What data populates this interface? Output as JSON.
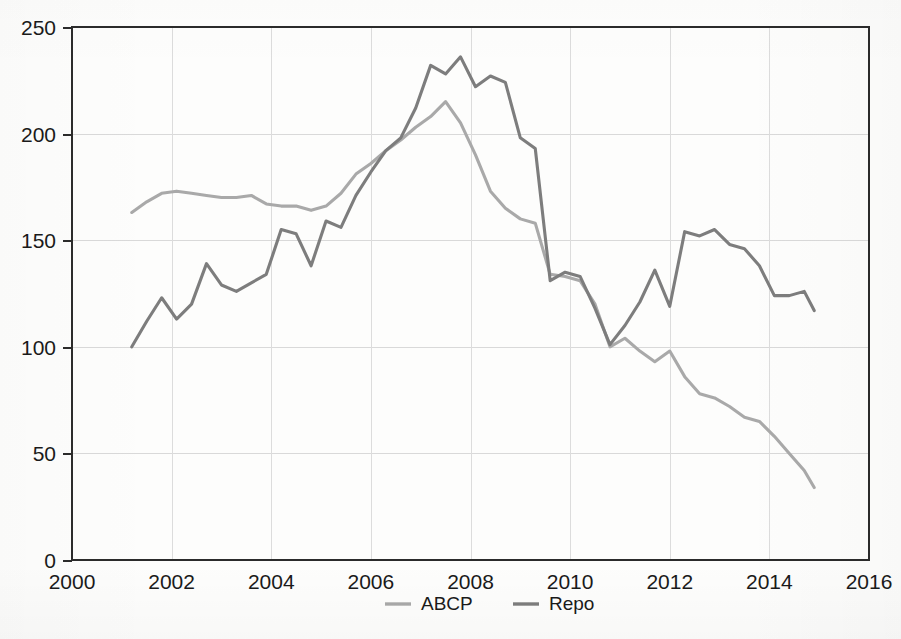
{
  "chart_data": {
    "type": "line",
    "title": "",
    "subtitle": "",
    "xlabel": "",
    "ylabel": "",
    "xlim": [
      2000,
      2016
    ],
    "ylim": [
      0,
      250
    ],
    "xticks": [
      2000,
      2002,
      2004,
      2006,
      2008,
      2010,
      2012,
      2014,
      2016
    ],
    "yticks": [
      0,
      50,
      100,
      150,
      200,
      250
    ],
    "xtick_labels": [
      "2000",
      "2002",
      "2004",
      "2006",
      "2008",
      "2010",
      "2012",
      "2014",
      "2016"
    ],
    "ytick_labels": [
      "0",
      "50",
      "100",
      "150",
      "200",
      "250"
    ],
    "grid": true,
    "grid_axes": "both",
    "legend_position": "bottom-center",
    "legend_entries": [
      "ABCP",
      "Repo"
    ],
    "colors": {
      "ABCP": "#a9a9a9",
      "Repo": "#7d7d7d",
      "axis": "#2b2b2b",
      "grid": "#d9d9d9",
      "background": "#fdfdfc",
      "text": "#1a1a1a"
    },
    "series": [
      {
        "name": "ABCP",
        "color": "#a9a9a9",
        "x": [
          2001.2,
          2001.5,
          2001.8,
          2002.1,
          2002.4,
          2002.7,
          2003.0,
          2003.3,
          2003.6,
          2003.9,
          2004.2,
          2004.5,
          2004.8,
          2005.1,
          2005.4,
          2005.7,
          2006.0,
          2006.3,
          2006.6,
          2006.9,
          2007.2,
          2007.5,
          2007.8,
          2008.1,
          2008.4,
          2008.7,
          2009.0,
          2009.3,
          2009.6,
          2009.9,
          2010.2,
          2010.5,
          2010.8,
          2011.1,
          2011.4,
          2011.7,
          2012.0,
          2012.3,
          2012.6,
          2012.9,
          2013.2,
          2013.5,
          2013.8,
          2014.1,
          2014.4,
          2014.7,
          2014.9
        ],
        "y": [
          163,
          168,
          172,
          173,
          172,
          171,
          170,
          170,
          171,
          167,
          166,
          166,
          164,
          166,
          172,
          181,
          186,
          192,
          197,
          203,
          208,
          215,
          205,
          190,
          173,
          165,
          160,
          158,
          134,
          133,
          131,
          120,
          100,
          104,
          98,
          93,
          98,
          86,
          78,
          76,
          72,
          67,
          65,
          58,
          50,
          42,
          34
        ]
      },
      {
        "name": "Repo",
        "color": "#7d7d7d",
        "x": [
          2001.2,
          2001.5,
          2001.8,
          2002.1,
          2002.4,
          2002.7,
          2003.0,
          2003.3,
          2003.6,
          2003.9,
          2004.2,
          2004.5,
          2004.8,
          2005.1,
          2005.4,
          2005.7,
          2006.0,
          2006.3,
          2006.6,
          2006.9,
          2007.2,
          2007.5,
          2007.8,
          2008.1,
          2008.4,
          2008.7,
          2009.0,
          2009.3,
          2009.6,
          2009.9,
          2010.2,
          2010.5,
          2010.8,
          2011.1,
          2011.4,
          2011.7,
          2012.0,
          2012.3,
          2012.6,
          2012.9,
          2013.2,
          2013.5,
          2013.8,
          2014.1,
          2014.4,
          2014.7,
          2014.9
        ],
        "y": [
          100,
          112,
          123,
          113,
          120,
          139,
          129,
          126,
          130,
          134,
          155,
          153,
          138,
          159,
          156,
          171,
          182,
          192,
          198,
          212,
          232,
          228,
          236,
          222,
          227,
          224,
          198,
          193,
          131,
          135,
          133,
          118,
          101,
          110,
          121,
          136,
          119,
          154,
          152,
          155,
          148,
          146,
          138,
          124,
          124,
          126,
          117
        ]
      }
    ]
  },
  "legend": {
    "items": [
      {
        "label": "ABCP",
        "color": "#a9a9a9"
      },
      {
        "label": "Repo",
        "color": "#7d7d7d"
      }
    ]
  },
  "axes": {
    "y": {
      "labels": [
        "250",
        "200",
        "150",
        "100",
        "50",
        "0"
      ]
    },
    "x": {
      "labels": [
        "2000",
        "2002",
        "2004",
        "2006",
        "2008",
        "2010",
        "2012",
        "2014",
        "2016"
      ]
    }
  }
}
